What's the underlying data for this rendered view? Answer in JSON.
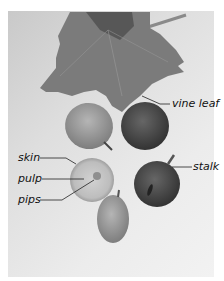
{
  "figure": {
    "colors": {
      "background": "#e6e6e6",
      "leaf": "#7a7a7a",
      "grape_light": "#9a9a9a",
      "grape_dark": "#4a4a4a",
      "label_text": "#111111",
      "leader_line": "#222222"
    },
    "labels": {
      "vine_leaf": "vine leaf",
      "skin": "skin",
      "pulp": "pulp",
      "pips": "pips",
      "stalk": "stalk"
    }
  }
}
